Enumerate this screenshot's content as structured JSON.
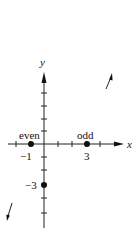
{
  "diagram": {
    "axes": {
      "x_label": "x",
      "y_label": "y"
    },
    "points": [
      {
        "label": "even",
        "coord": "-1",
        "x": -1,
        "y": 0
      },
      {
        "label": "odd",
        "coord": "3",
        "x": 3,
        "y": 0
      },
      {
        "label": "",
        "coord": "-3",
        "x": 0,
        "y": -3
      }
    ],
    "tick_labels": {
      "x_neg1": "−1",
      "x_3": "3",
      "y_neg3": "−3"
    },
    "point_labels": {
      "even": "even",
      "odd": "odd"
    },
    "arrows": [
      {
        "name": "up-right-arrow",
        "direction": "up-right"
      },
      {
        "name": "down-left-arrow",
        "direction": "down-left"
      }
    ]
  }
}
